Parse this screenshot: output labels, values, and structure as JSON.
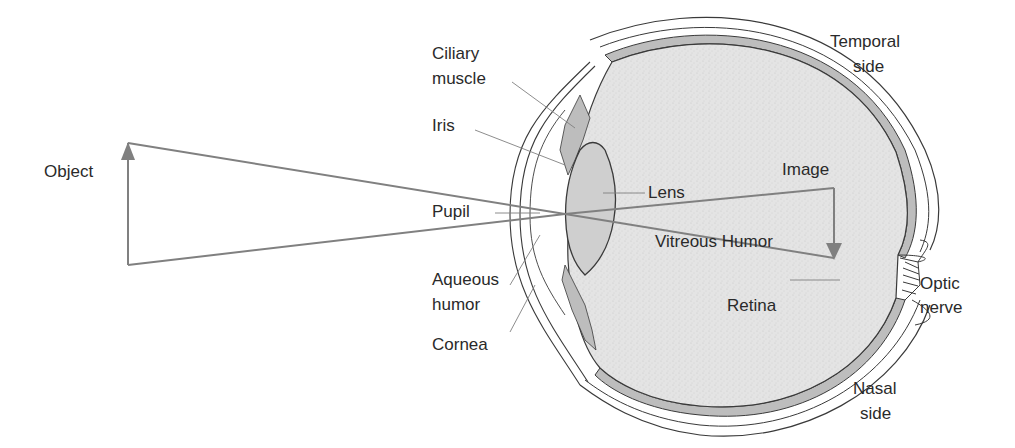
{
  "diagram": {
    "labels": {
      "object": "Object",
      "ciliary_1": "Ciliary",
      "ciliary_2": "muscle",
      "iris": "Iris",
      "pupil": "Pupil",
      "aqueous_1": "Aqueous",
      "aqueous_2": "humor",
      "cornea": "Cornea",
      "lens": "Lens",
      "vitreous": "Vitreous Humor",
      "image": "Image",
      "temporal_1": "Temporal",
      "temporal_2": "side",
      "retina": "Retina",
      "optic_1": "Optic",
      "optic_2": "nerve",
      "nasal_1": "Nasal",
      "nasal_2": "side"
    },
    "colors": {
      "ray": "#808080",
      "outline": "#3a3a3a",
      "vitreous_fill": "#e2e2e2",
      "tissue_fill": "#bdbdbd",
      "text": "#2a2a2a"
    }
  }
}
